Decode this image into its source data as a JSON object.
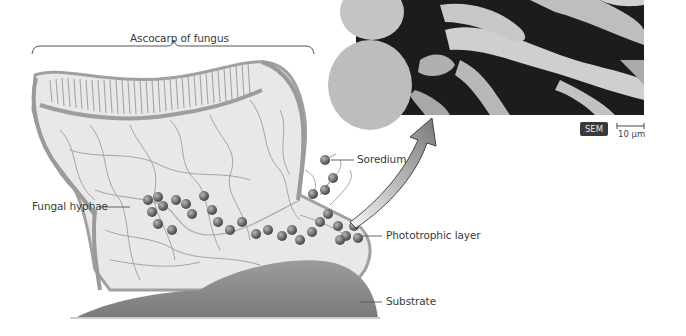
{
  "figure": {
    "title_bracket_label": "Ascocarp of fungus",
    "labels": {
      "soredium": "Soredium",
      "fungal_hyphae": "Fungal hyphae",
      "phototrophic_layer": "Phototrophic layer",
      "substrate": "Substrate"
    },
    "micrograph": {
      "badge": "SEM",
      "scale_bar": "10 µm"
    },
    "colors": {
      "hyphae": "#9a9a9a",
      "thallus_fill": "#e6e6e6",
      "algal_cells": "#6a6a6a",
      "substrate": "#8a8a8a",
      "badge_bg": "#3a3a3a",
      "micrograph_dark": "#1a1a1a"
    }
  }
}
